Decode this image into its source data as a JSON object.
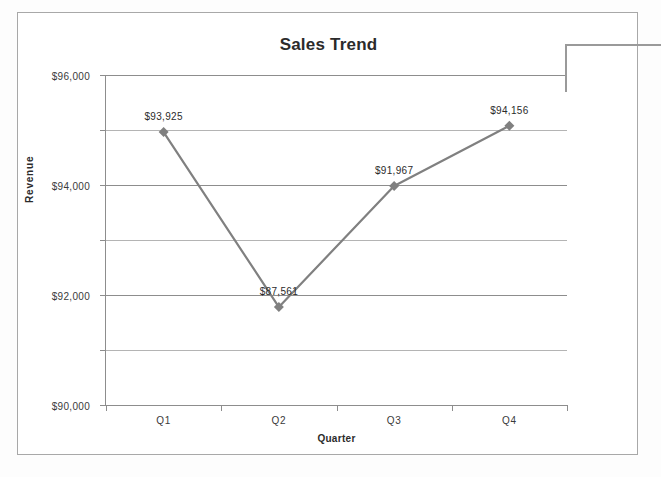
{
  "chart": {
    "title": "Sales Trend",
    "x_axis_title": "Quarter",
    "y_axis_title": "Revenue"
  },
  "chart_data": {
    "type": "line",
    "title": "Sales Trend",
    "xlabel": "Quarter",
    "ylabel": "Revenue",
    "categories": [
      "Q1",
      "Q2",
      "Q3",
      "Q4"
    ],
    "values": [
      93925,
      87561,
      91967,
      94156
    ],
    "data_labels": [
      "$93,925",
      "$87,561",
      "$91,967",
      "$94,156"
    ],
    "ylim": [
      84000,
      96000
    ],
    "ytick_labels": [
      "$96,000",
      "$94,000",
      "$92,000",
      "$90,000",
      "$88,000",
      "$86,000",
      "$84,000"
    ],
    "ytick_values": [
      96000,
      94000,
      92000,
      90000,
      88000,
      86000,
      84000
    ],
    "grid": true,
    "legend": "none",
    "series": [
      {
        "name": "Revenue",
        "values": [
          93925,
          87561,
          91967,
          94156
        ],
        "color": "#808080",
        "marker": "diamond"
      }
    ],
    "annotations": [
      {
        "name": "leader-line",
        "text": ""
      }
    ]
  },
  "colors": {
    "series": "#808080",
    "gridline": "#8d8d8d",
    "axis": "#8d8d8d",
    "text": "#2b2b2b",
    "frame": "#a8a8a8"
  }
}
